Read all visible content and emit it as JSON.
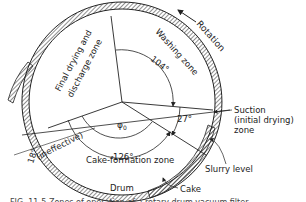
{
  "figure": {
    "labels": {
      "rotation": "Rotation",
      "washing_zone": "Washing zone",
      "final_drying": "Final drying and",
      "discharge_zone": "discharge zone",
      "washing_angle": "104°",
      "suction_angle": "27°",
      "cake_formation_angle": "126°",
      "phi": "φ",
      "phi_sub": "0",
      "ineffective": "(ineffective)",
      "ineffective_angle": "18°",
      "cake_formation_zone": "Cake-formation zone",
      "suction_line1": "Suction",
      "suction_line2": "(initial drying)",
      "suction_line3": "zone",
      "slurry_level": "Slurry level",
      "drum": "Drum",
      "cake": "Cake"
    },
    "caption": "FIG. 11-5  Zones of operation of a rotary drum vacuum filter."
  },
  "colors": {
    "ink": "#222222",
    "background": "#ffffff"
  }
}
